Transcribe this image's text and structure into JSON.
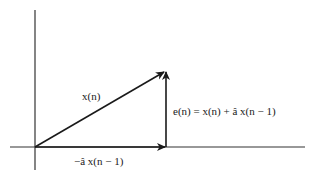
{
  "diagram": {
    "type": "vector-diagram",
    "colors": {
      "stroke": "#1a1a1a",
      "background": "#ffffff"
    },
    "axes": {
      "vertical": {
        "x": 35,
        "y1": 10,
        "y2": 170
      },
      "horizontal": {
        "y": 147,
        "x1": 10,
        "x2": 305
      }
    },
    "vectors": [
      {
        "id": "x_n",
        "from": [
          35,
          147
        ],
        "to": [
          166,
          71
        ],
        "label": "x(n)"
      },
      {
        "id": "minus_a_hat_x_n_minus_1",
        "from": [
          35,
          147
        ],
        "to": [
          166,
          147
        ],
        "label": "−â x(n − 1)"
      },
      {
        "id": "e_n",
        "from": [
          166,
          147
        ],
        "to": [
          166,
          71
        ],
        "label": "e(n) = x(n) + â x(n − 1)"
      }
    ],
    "labels": {
      "x_n": "x(n)",
      "horizontal_vector": "−â x(n − 1)",
      "error_vector": "e(n) = x(n) + â x(n − 1)"
    }
  }
}
